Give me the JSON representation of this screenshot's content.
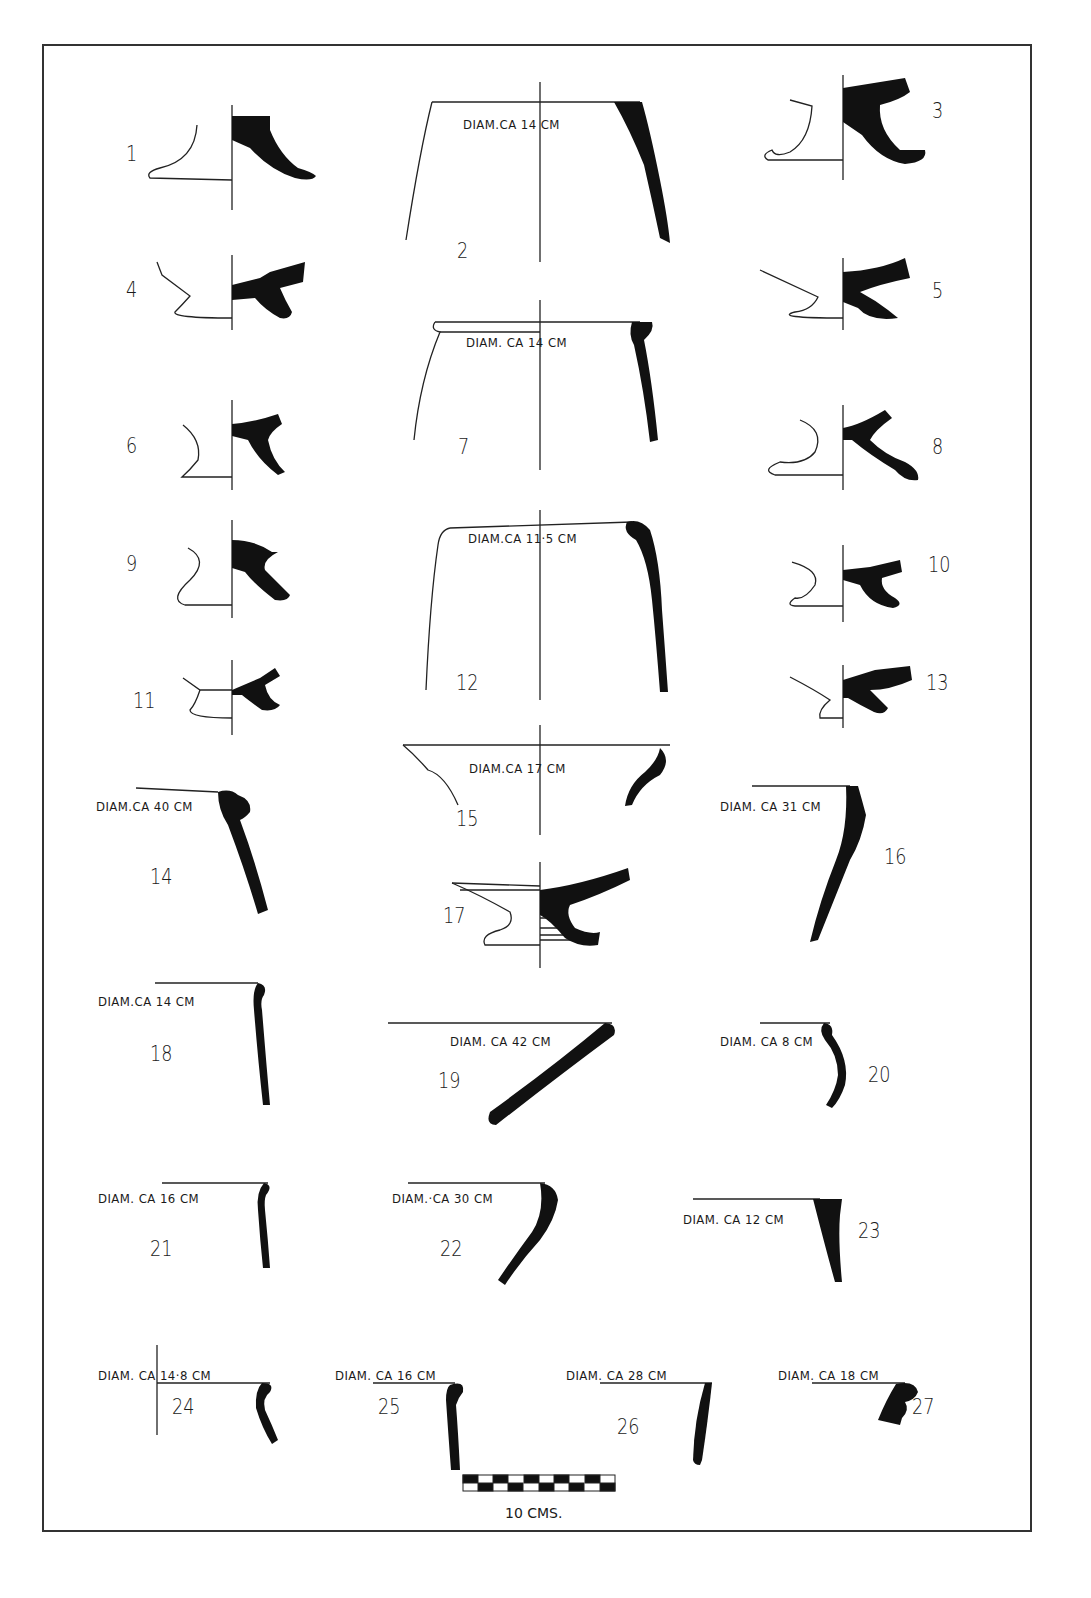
{
  "plate": {
    "frame_color": "#333333",
    "ink_color": "#111111"
  },
  "figures": [
    {
      "id": "1",
      "label": "1",
      "diameter": ""
    },
    {
      "id": "2",
      "label": "2",
      "diameter": "DIAM.CA 14 CM"
    },
    {
      "id": "3",
      "label": "3",
      "diameter": ""
    },
    {
      "id": "4",
      "label": "4",
      "diameter": ""
    },
    {
      "id": "5",
      "label": "5",
      "diameter": ""
    },
    {
      "id": "6",
      "label": "6",
      "diameter": ""
    },
    {
      "id": "7",
      "label": "7",
      "diameter": "DIAM. CA 14 CM"
    },
    {
      "id": "8",
      "label": "8",
      "diameter": ""
    },
    {
      "id": "9",
      "label": "9",
      "diameter": ""
    },
    {
      "id": "10",
      "label": "10",
      "diameter": ""
    },
    {
      "id": "11",
      "label": "11",
      "diameter": ""
    },
    {
      "id": "12",
      "label": "12",
      "diameter": "DIAM.CA 11·5 CM"
    },
    {
      "id": "13",
      "label": "13",
      "diameter": ""
    },
    {
      "id": "14",
      "label": "14",
      "diameter": "DIAM.CA 40 CM"
    },
    {
      "id": "15",
      "label": "15",
      "diameter": "DIAM.CA 17 CM"
    },
    {
      "id": "16",
      "label": "16",
      "diameter": "DIAM. CA 31 CM"
    },
    {
      "id": "17",
      "label": "17",
      "diameter": ""
    },
    {
      "id": "18",
      "label": "18",
      "diameter": "DIAM.CA 14 CM"
    },
    {
      "id": "19",
      "label": "19",
      "diameter": "DIAM. CA 42 CM"
    },
    {
      "id": "20",
      "label": "20",
      "diameter": "DIAM. CA 8 CM"
    },
    {
      "id": "21",
      "label": "21",
      "diameter": "DIAM. CA 16 CM"
    },
    {
      "id": "22",
      "label": "22",
      "diameter": "DIAM.·CA 30 CM"
    },
    {
      "id": "23",
      "label": "23",
      "diameter": "DIAM. CA 12 CM"
    },
    {
      "id": "24",
      "label": "24",
      "diameter": "DIAM. CA 14·8 CM"
    },
    {
      "id": "25",
      "label": "25",
      "diameter": "DIAM. CA 16 CM"
    },
    {
      "id": "26",
      "label": "26",
      "diameter": "DIAM. CA 28 CM"
    },
    {
      "id": "27",
      "label": "27",
      "diameter": "DIAM. CA 18 CM"
    }
  ],
  "scale_bar": {
    "label": "10 CMS.",
    "segments": 10
  }
}
